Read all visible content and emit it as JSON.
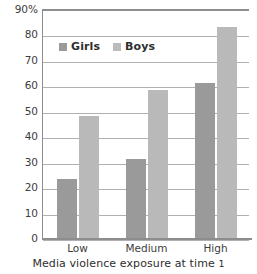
{
  "chart_data": {
    "type": "bar",
    "title": "",
    "xlabel": "Media violence exposure at time 1",
    "ylabel": "",
    "categories": [
      "Low",
      "Medium",
      "High"
    ],
    "series": [
      {
        "name": "Girls",
        "values": [
          23,
          31,
          61
        ],
        "color": "#9a9a9a"
      },
      {
        "name": "Boys",
        "values": [
          48,
          58,
          83
        ],
        "color": "#b9b9b9"
      }
    ],
    "ylim": [
      0,
      90
    ],
    "ytick_values": [
      90,
      80,
      70,
      60,
      50,
      40,
      30,
      20,
      10,
      0
    ],
    "ytick_labels": [
      "90%",
      "80",
      "70",
      "60",
      "50",
      "40",
      "30",
      "20",
      "10",
      "0"
    ],
    "grid": true,
    "legend_position": "top-left-inside",
    "axis_title_suffix_numeral": "1"
  },
  "legend": {
    "entries": [
      {
        "label": "Girls",
        "swatch": "girls-swatch"
      },
      {
        "label": "Boys",
        "swatch": "boys-swatch"
      }
    ]
  }
}
